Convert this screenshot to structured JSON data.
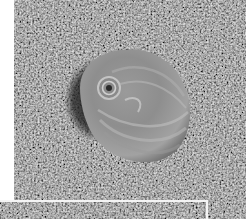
{
  "image": {
    "description": "Grayscale photograph of a moon snail shell resting on coarse sand",
    "subject": "moon snail shell",
    "background": "sand",
    "colors": {
      "sand_mid": "#6e6e6e",
      "sand_dark": "#3a3a3a",
      "sand_light": "#a8a8a8",
      "shell_light": "#b4b4b4",
      "shell_mid": "#8c8c8c",
      "shadow": "#1e1e1e",
      "border": "#ffffff"
    }
  }
}
